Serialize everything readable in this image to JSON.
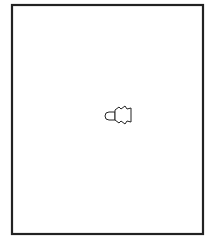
{
  "figure": {
    "frame": {
      "x": 12,
      "y": 5,
      "width": 191,
      "height": 229,
      "stroke": "#222222"
    },
    "origin": {
      "x": 130,
      "y": 114
    },
    "rays": [
      {
        "x": 78,
        "y": 22
      },
      {
        "x": 83,
        "y": 19
      },
      {
        "x": 93,
        "y": 16
      },
      {
        "x": 50,
        "y": 42
      },
      {
        "x": 30,
        "y": 80
      },
      {
        "x": 27,
        "y": 135
      },
      {
        "x": 66,
        "y": 161
      },
      {
        "x": 48,
        "y": 198
      },
      {
        "x": 68,
        "y": 206
      },
      {
        "x": 80,
        "y": 203
      },
      {
        "x": 82,
        "y": 213
      }
    ],
    "tail": {
      "x_start": 132,
      "x_end": 201,
      "segments": 16
    }
  }
}
